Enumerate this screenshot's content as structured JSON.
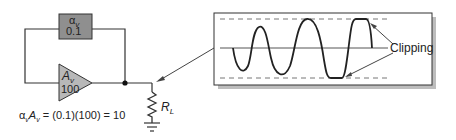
{
  "feedback_block": {
    "symbol": "α",
    "subscript": "v",
    "value": "0.1",
    "fill": "#8f8f8f"
  },
  "amplifier": {
    "symbol": "A",
    "subscript": "v",
    "value": "100",
    "fill": "#b8b8b8"
  },
  "load": {
    "symbol": "R",
    "subscript": "L"
  },
  "equation": {
    "lhs": "αvAv",
    "rhs": "= (0.1)(100) = 10",
    "a1": "α",
    "s1": "v",
    "a2": "A",
    "s2": "v"
  },
  "scope": {
    "annotation": "Clipping"
  },
  "colors": {
    "line": "#333333",
    "wave": "#222222",
    "dash": "#777777",
    "shadow": "#bdbdbd"
  }
}
